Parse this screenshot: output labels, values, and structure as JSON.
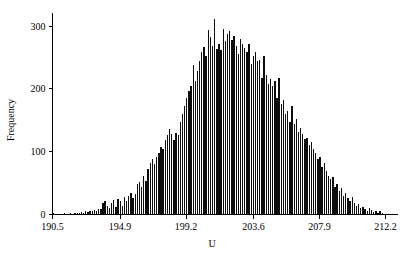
{
  "chart_data": {
    "type": "bar",
    "title": "",
    "subtitle": "",
    "xlabel": "U",
    "ylabel": "Frequency",
    "grid": false,
    "legend": null,
    "xlim": [
      190.5,
      212.2
    ],
    "ylim": [
      0,
      320
    ],
    "xticks": [
      "190.5",
      "194.9",
      "199.2",
      "203.6",
      "207.9",
      "212.2"
    ],
    "xtick_values": [
      190.5,
      194.9,
      199.2,
      203.6,
      207.9,
      212.2
    ],
    "yticks": [
      "0",
      "100",
      "200",
      "300"
    ],
    "ytick_values": [
      0,
      100,
      200,
      300
    ],
    "bar_color": "#0d0d0d",
    "axis_color": "#000000",
    "bin_width": 0.1405,
    "x": [
      190.57,
      190.71,
      190.85,
      190.99,
      191.13,
      191.27,
      191.41,
      191.55,
      191.69,
      191.83,
      191.97,
      192.11,
      192.25,
      192.39,
      192.53,
      192.67,
      192.81,
      192.95,
      193.09,
      193.23,
      193.37,
      193.51,
      193.65,
      193.79,
      193.93,
      194.07,
      194.21,
      194.35,
      194.49,
      194.63,
      194.77,
      194.91,
      195.05,
      195.19,
      195.33,
      195.47,
      195.61,
      195.75,
      195.89,
      196.03,
      196.17,
      196.31,
      196.45,
      196.59,
      196.73,
      196.87,
      197.01,
      197.15,
      197.29,
      197.43,
      197.57,
      197.71,
      197.85,
      197.99,
      198.13,
      198.27,
      198.41,
      198.55,
      198.69,
      198.83,
      198.97,
      199.11,
      199.25,
      199.39,
      199.53,
      199.67,
      199.81,
      199.95,
      200.09,
      200.23,
      200.37,
      200.51,
      200.65,
      200.79,
      200.93,
      201.07,
      201.21,
      201.35,
      201.49,
      201.63,
      201.77,
      201.91,
      202.05,
      202.19,
      202.33,
      202.47,
      202.61,
      202.75,
      202.89,
      203.03,
      203.17,
      203.31,
      203.45,
      203.59,
      203.73,
      203.87,
      204.01,
      204.15,
      204.29,
      204.43,
      204.57,
      204.71,
      204.85,
      204.99,
      205.13,
      205.27,
      205.41,
      205.55,
      205.69,
      205.83,
      205.97,
      206.11,
      206.25,
      206.39,
      206.53,
      206.67,
      206.81,
      206.95,
      207.09,
      207.23,
      207.37,
      207.51,
      207.65,
      207.79,
      207.93,
      208.07,
      208.21,
      208.35,
      208.49,
      208.63,
      208.77,
      208.91,
      209.05,
      209.19,
      209.33,
      209.47,
      209.61,
      209.75,
      209.89,
      210.03,
      210.17,
      210.31,
      210.45,
      210.59,
      210.73,
      210.87,
      211.01,
      211.15,
      211.29,
      211.43,
      211.57,
      211.71,
      211.85,
      211.99,
      212.13
    ],
    "values": [
      2,
      0,
      0,
      1,
      0,
      2,
      1,
      0,
      2,
      1,
      2,
      3,
      2,
      4,
      3,
      5,
      4,
      6,
      5,
      7,
      6,
      9,
      8,
      19,
      21,
      14,
      10,
      18,
      23,
      12,
      24,
      22,
      14,
      28,
      22,
      30,
      35,
      27,
      33,
      48,
      52,
      44,
      62,
      53,
      72,
      82,
      88,
      80,
      92,
      98,
      108,
      104,
      118,
      126,
      136,
      128,
      118,
      130,
      126,
      148,
      160,
      172,
      186,
      196,
      205,
      238,
      212,
      228,
      245,
      258,
      266,
      252,
      294,
      282,
      268,
      311,
      264,
      272,
      262,
      295,
      276,
      288,
      292,
      278,
      284,
      268,
      256,
      280,
      272,
      265,
      258,
      272,
      240,
      252,
      258,
      244,
      246,
      218,
      252,
      222,
      208,
      216,
      204,
      212,
      186,
      218,
      176,
      182,
      160,
      165,
      148,
      172,
      144,
      152,
      132,
      138,
      128,
      120,
      122,
      110,
      116,
      104,
      98,
      88,
      92,
      76,
      82,
      70,
      62,
      56,
      60,
      44,
      48,
      38,
      42,
      30,
      34,
      26,
      22,
      28,
      18,
      14,
      16,
      10,
      12,
      8,
      6,
      10,
      7,
      4,
      6,
      3,
      5,
      2,
      1
    ]
  },
  "axis": {
    "ylabel": "Frequency",
    "xlabel": "U"
  }
}
